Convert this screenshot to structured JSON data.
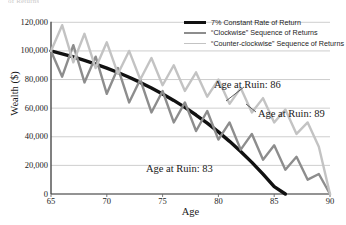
{
  "cut_off_title": "of Returns",
  "axes": {
    "y_label": "Wealth ($)",
    "x_label": "Age",
    "y_ticks": [
      "120,000",
      "100,000",
      "80,000",
      "60,000",
      "40,000",
      "20,000",
      "0"
    ],
    "x_ticks": [
      "65",
      "70",
      "75",
      "80",
      "85",
      "90"
    ]
  },
  "legend": {
    "items": [
      {
        "label": "7% Constant Rate of Return",
        "color": "#111111"
      },
      {
        "label": "“Clockwise” Sequence of Returns",
        "color": "#8d8d8d"
      },
      {
        "label": "“Counter-clockwise” Sequence of Returns",
        "color": "#c3c3c3"
      }
    ]
  },
  "annotations": [
    {
      "text": "Age at Ruin: 86",
      "series": "7% Constant Rate of Return",
      "age": 86
    },
    {
      "text": "Age at Ruin: 89",
      "series": "“Counter-clockwise” Sequence of Returns",
      "age": 89
    },
    {
      "text": "Age at Ruin: 83",
      "series": "“Clockwise” Sequence of Returns",
      "age": 83
    }
  ],
  "chart_data": {
    "type": "line",
    "title": "",
    "xlabel": "Age",
    "ylabel": "Wealth ($)",
    "xlim": [
      65,
      90
    ],
    "ylim": [
      0,
      120000
    ],
    "grid": true,
    "legend_position": "top-right",
    "x": [
      65,
      66,
      67,
      68,
      69,
      70,
      71,
      72,
      73,
      74,
      75,
      76,
      77,
      78,
      79,
      80,
      81,
      82,
      83,
      84,
      85,
      86,
      87,
      88,
      89,
      90
    ],
    "series": [
      {
        "name": "7% Constant Rate of Return",
        "color": "#111111",
        "width": 3.4,
        "ruin_age": 86,
        "values": [
          100000,
          98000,
          95800,
          93400,
          90800,
          88000,
          84900,
          81600,
          78000,
          74100,
          69900,
          65400,
          60500,
          55200,
          49500,
          43400,
          36800,
          29700,
          22100,
          13900,
          5100,
          0,
          0,
          0,
          0,
          0
        ]
      },
      {
        "name": "“Clockwise” Sequence of Returns",
        "color": "#8d8d8d",
        "width": 2.4,
        "ruin_age": 83,
        "values": [
          100000,
          82000,
          104000,
          78000,
          96000,
          70000,
          88000,
          64000,
          80000,
          57000,
          72000,
          50000,
          64000,
          44000,
          58000,
          38000,
          50000,
          31000,
          42000,
          24000,
          34000,
          17000,
          26000,
          10000,
          14000,
          0
        ]
      },
      {
        "name": "“Counter-clockwise” Sequence of Returns",
        "color": "#c3c3c3",
        "width": 2.4,
        "ruin_age": 89,
        "values": [
          100000,
          118000,
          92000,
          112000,
          88000,
          106000,
          84000,
          100000,
          80000,
          95000,
          76000,
          90000,
          72000,
          85000,
          68000,
          80000,
          63000,
          74000,
          57000,
          67000,
          50000,
          59000,
          42000,
          50000,
          33000,
          0
        ]
      }
    ]
  }
}
